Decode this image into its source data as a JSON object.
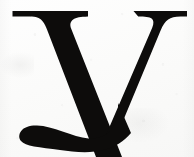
{
  "image": {
    "kind": "scanned-letterform",
    "subject": "lowercase-letter-y",
    "character": "y",
    "typeface_style": "serif",
    "case": "lowercase",
    "alt_text": "Scanned black serif lowercase letter y on off-white paper",
    "width_px": 194,
    "height_px": 157
  },
  "colors": {
    "ink": "#0d0c0b",
    "ink_soft_edge": "#231f1d",
    "paper": "#fdfdfc",
    "paper_shadow": "#f3f3f1",
    "texture_fleck": "#78787655"
  },
  "glyph_geometry": {
    "left_serif": {
      "x_start": 12,
      "x_end": 88,
      "top_y": 11,
      "bar_thickness": 6
    },
    "right_serif": {
      "x_start": 133,
      "x_end": 187,
      "top_y": 11,
      "bar_thickness": 6
    },
    "junction": {
      "x": 105,
      "y": 86
    },
    "thick_diagonal": "left-serif down-right to junction",
    "thin_diagonal": "right-serif down-left to junction",
    "descender_tail": {
      "tip_x": 22,
      "tip_y": 135,
      "bottom_y": 148,
      "terminal": "blunt-rounded"
    }
  },
  "labels": {
    "glyph_caption": "y",
    "background_caption": "paper background"
  }
}
